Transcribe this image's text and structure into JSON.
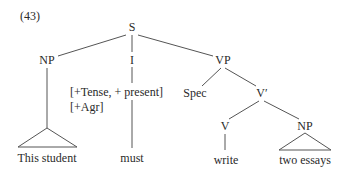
{
  "example_number": "(43)",
  "tree": {
    "root": {
      "label": "S"
    },
    "subject": {
      "label": "NP",
      "terminal": "This student"
    },
    "infl": {
      "label": "I",
      "features": [
        "[+Tense, + present]",
        "[+Agr]"
      ],
      "terminal": "must"
    },
    "vp": {
      "label": "VP",
      "spec": {
        "label": "Spec"
      },
      "vbar": {
        "label": "V′",
        "verb": {
          "label": "V",
          "terminal": "write"
        },
        "object": {
          "label": "NP",
          "terminal": "two essays"
        }
      }
    }
  },
  "colors": {
    "text": "#2a2a2a",
    "lines": "#555555",
    "background": "#ffffff"
  }
}
